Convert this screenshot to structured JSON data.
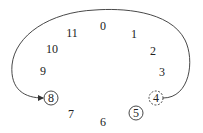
{
  "diagram": {
    "type": "clock-modular-arithmetic",
    "colors": {
      "stroke": "#333333",
      "text": "#222222",
      "background": "#ffffff"
    },
    "numbers": [
      {
        "label": "0",
        "x": 103,
        "y": 30,
        "marker": "none"
      },
      {
        "label": "1",
        "x": 134,
        "y": 38,
        "marker": "none"
      },
      {
        "label": "2",
        "x": 153,
        "y": 55,
        "marker": "none"
      },
      {
        "label": "3",
        "x": 162,
        "y": 76,
        "marker": "none"
      },
      {
        "label": "4",
        "x": 156,
        "y": 102,
        "marker": "dashed-circle"
      },
      {
        "label": "5",
        "x": 136,
        "y": 117,
        "marker": "solid-circle"
      },
      {
        "label": "6",
        "x": 103,
        "y": 126,
        "marker": "none"
      },
      {
        "label": "7",
        "x": 71,
        "y": 118,
        "marker": "none"
      },
      {
        "label": "8",
        "x": 51,
        "y": 102,
        "marker": "solid-circle"
      },
      {
        "label": "9",
        "x": 43,
        "y": 75,
        "marker": "none"
      },
      {
        "label": "10",
        "x": 52,
        "y": 53,
        "marker": "none"
      },
      {
        "label": "11",
        "x": 72,
        "y": 37,
        "marker": "none"
      }
    ],
    "arrow": {
      "from": "4",
      "to": "8",
      "direction": "counter-clockwise over the top"
    }
  }
}
